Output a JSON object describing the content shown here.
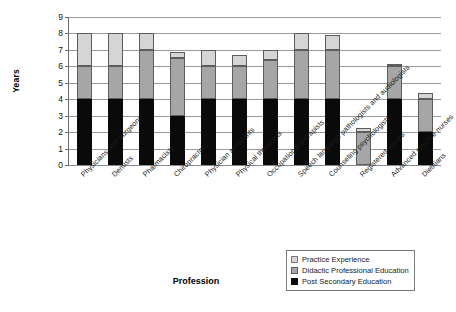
{
  "chart_data": {
    "type": "bar",
    "stacked": true,
    "title": "",
    "xlabel": "Profession",
    "ylabel": "Years",
    "ylim": [
      0,
      9
    ],
    "yticks": [
      0,
      1,
      2,
      3,
      4,
      5,
      6,
      7,
      8,
      9
    ],
    "grid": true,
    "legend_position": "bottom-right",
    "categories": [
      "Physicians and Surgeons",
      "Dentists",
      "Pharmacists",
      "Chiropractors",
      "Physician assistants",
      "Physical therapists",
      "Occupational therapists",
      "Speech language pathologists and audiologists",
      "Counseling psychologists",
      "Registered nurses",
      "Advanced practice nurses",
      "Dietitians"
    ],
    "series": [
      {
        "name": "Post Secondary Education",
        "color": "#0a0a0a",
        "values": [
          4,
          4,
          4,
          3,
          4,
          4,
          4,
          4,
          4,
          0,
          4,
          2
        ]
      },
      {
        "name": "Didactic Professional Education",
        "color": "#a6a6a6",
        "values": [
          2,
          2,
          3,
          3.5,
          2,
          2,
          2.4,
          3,
          3,
          2,
          2,
          2
        ]
      },
      {
        "name": "Practice Experience",
        "color": "#d5d5d5",
        "values": [
          2,
          2,
          1,
          0.4,
          1,
          0.7,
          0.6,
          1,
          0.9,
          0.25,
          0.1,
          0.35
        ]
      }
    ],
    "totals": [
      8,
      8,
      8,
      6.9,
      7,
      6.7,
      7,
      8,
      7.9,
      2.25,
      6.1,
      4.35
    ]
  },
  "legend": {
    "entries": [
      {
        "label": "Practice Experience",
        "swatch": "s2"
      },
      {
        "label": "Didactic Professional Education",
        "swatch": "s1"
      },
      {
        "label": "Post Secondary Education",
        "swatch": "s0"
      }
    ]
  }
}
